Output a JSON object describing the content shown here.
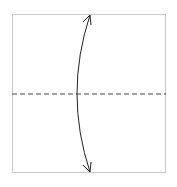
{
  "diagram": {
    "type": "origami-fold-step",
    "paper": {
      "x": 12,
      "y": 14,
      "width": 154,
      "height": 159,
      "stroke": "#c8c8c8",
      "fill": "#ffffff"
    },
    "valley_fold_line": {
      "y": 94,
      "stroke": "#444444",
      "style": "dashed"
    },
    "fold_arrow": {
      "from": [
        90,
        14
      ],
      "to": [
        90,
        173
      ],
      "control_x": 64,
      "stroke": "#222222",
      "bidirectional": true
    },
    "labels": []
  }
}
